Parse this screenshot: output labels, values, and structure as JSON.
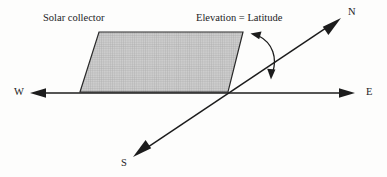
{
  "figure": {
    "type": "diagram",
    "background_color": "#fdfdfc",
    "line_color": "#1c1c1c",
    "collector_fill_color": "#c9c9c9",
    "collector_grid_color": "#9a9a9a"
  },
  "labels": {
    "solar_collector": "Solar collector",
    "elevation_latitude": "Elevation = Latitude",
    "north": "N",
    "west": "W",
    "east": "E",
    "south": "S"
  },
  "geometry": {
    "collector_polygon": "99,32 243,32 228,92 80,92",
    "ew_axis": {
      "from_x": 30,
      "from_y": 93,
      "to_x": 355,
      "to_y": 93
    },
    "ns_axis": {
      "from_x": 133,
      "from_y": 157,
      "to_x": 341,
      "to_y": 18
    },
    "axes_intersection": {
      "x": 225,
      "y": 93
    },
    "angle_arc_path": "M 256,36 C 272,44 276,58 272,74"
  },
  "annotations": {
    "angle_arc": "double-headed-arc-between-collector-edge-and-north-axis"
  }
}
